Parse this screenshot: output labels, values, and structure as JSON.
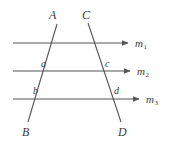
{
  "figure": {
    "background_color": "#ffffff",
    "stroke_color": "#555555",
    "text_color": "#3a3a3a",
    "width": 177,
    "height": 143
  },
  "parallel_lines": [
    {
      "name": "m1",
      "label": "m",
      "subscript": "1",
      "x_start": 13,
      "y": 43,
      "x_end": 128,
      "label_x": 135,
      "label_y": 38
    },
    {
      "name": "m2",
      "label": "m",
      "subscript": "2",
      "x_start": 13,
      "y": 71,
      "x_end": 130,
      "label_x": 137,
      "label_y": 66
    },
    {
      "name": "m3",
      "label": "m",
      "subscript": "3",
      "x_start": 13,
      "y": 99,
      "x_end": 139,
      "label_x": 146,
      "label_y": 94
    }
  ],
  "transversals": [
    {
      "name": "line-AB",
      "x1": 57,
      "y1": 24,
      "x2": 28,
      "y2": 122
    },
    {
      "name": "line-CD",
      "x1": 88,
      "y1": 23,
      "x2": 121,
      "y2": 122
    }
  ],
  "vertex_labels": [
    {
      "name": "label-A",
      "text": "A",
      "x": 49,
      "y": 9
    },
    {
      "name": "label-C",
      "text": "C",
      "x": 82,
      "y": 9
    },
    {
      "name": "label-B",
      "text": "B",
      "x": 22,
      "y": 126
    },
    {
      "name": "label-D",
      "text": "D",
      "x": 118,
      "y": 126
    }
  ],
  "angle_labels": [
    {
      "name": "label-a",
      "text": "a",
      "x": 41,
      "y": 59
    },
    {
      "name": "label-c",
      "text": "c",
      "x": 105,
      "y": 59
    },
    {
      "name": "label-b",
      "text": "b",
      "x": 33,
      "y": 86
    },
    {
      "name": "label-d",
      "text": "d",
      "x": 114,
      "y": 86
    }
  ]
}
